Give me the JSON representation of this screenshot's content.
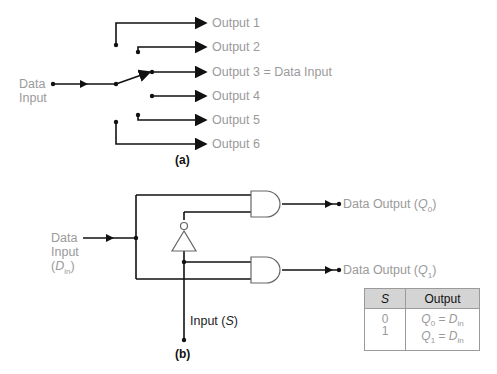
{
  "part_a": {
    "caption": "(a)",
    "input_label_line1": "Data",
    "input_label_line2": "Input",
    "outputs": [
      "Output 1",
      "Output 2",
      "Output 3 = Data Input",
      "Output 4",
      "Output 5",
      "Output 6"
    ]
  },
  "part_b": {
    "caption": "(b)",
    "input_label_line1": "Data",
    "input_label_line2": "Input",
    "input_label_sym": "D",
    "input_label_sub": "in",
    "select_label": "Input (",
    "select_sym": "S",
    "select_close": ")",
    "output0_prefix": "Data Output (",
    "output0_sym": "Q",
    "output0_sub": "0",
    "output1_prefix": "Data Output (",
    "output1_sym": "Q",
    "output1_sub": "1",
    "close_paren": ")"
  },
  "truth_table": {
    "headers": [
      "S",
      "Output"
    ],
    "rows": [
      {
        "s": "0",
        "q": "Q",
        "q_sub": "0",
        "eq": " = ",
        "d": "D",
        "d_sub": "in"
      },
      {
        "s": "1",
        "q": "Q",
        "q_sub": "1",
        "eq": " = ",
        "d": "D",
        "d_sub": "in"
      }
    ]
  }
}
